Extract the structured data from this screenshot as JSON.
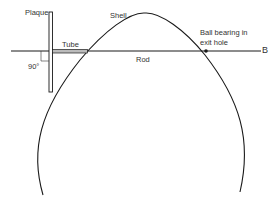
{
  "diagram": {
    "labels": {
      "plaque": "Plaque",
      "shell": "Shell",
      "tube": "Tube",
      "rod": "Rod",
      "angle": "90°",
      "ball_line1": "Ball bearing in",
      "ball_line2": "exit hole",
      "endpoint": "B"
    },
    "colors": {
      "stroke": "#1a1a1a",
      "background": "#ffffff"
    }
  }
}
